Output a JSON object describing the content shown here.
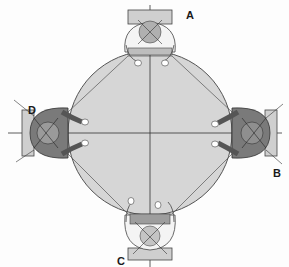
{
  "diagram": {
    "type": "seating-plan",
    "labels": {
      "top": "A",
      "right": "B",
      "bottom": "C",
      "left": "D"
    },
    "colors": {
      "table_fill": "#d6d6d6",
      "table_stroke": "#555555",
      "person_dark": "#7a7a7a",
      "person_light": "#f2f2f2",
      "line": "#333333",
      "background": "#fdfdfd"
    }
  }
}
